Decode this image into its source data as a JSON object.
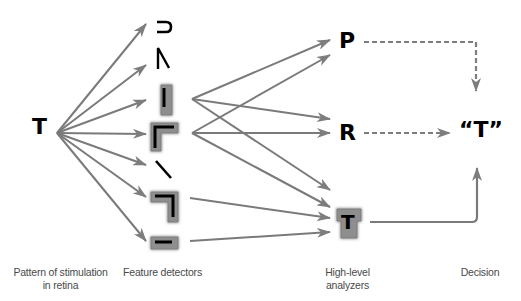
{
  "diagram": {
    "type": "flow",
    "title": "",
    "stages": [
      {
        "id": "retina",
        "label_line1": "Pattern of stimulation",
        "label_line2": "in retina",
        "content": "T"
      },
      {
        "id": "features",
        "label": "Feature detectors",
        "items": [
          "curve",
          "angle-up",
          "vertical-line",
          "corner-top-left",
          "diagonal",
          "corner-top-right",
          "horizontal-line"
        ]
      },
      {
        "id": "analyzers",
        "label_line1": "High-level",
        "label_line2": "analyzers",
        "items": [
          "P",
          "R",
          "T"
        ]
      },
      {
        "id": "decision",
        "label": "Decision",
        "content": "“T”"
      }
    ],
    "retina_letter": "T",
    "analyzers": {
      "p": "P",
      "r": "R",
      "t": "T"
    },
    "decision_text": "“T”",
    "labels": {
      "retina_1": "Pattern of stimulation",
      "retina_2": "in retina",
      "features": "Feature detectors",
      "analyzers_1": "High-level",
      "analyzers_2": "analyzers",
      "decision": "Decision"
    },
    "highlighted_features": [
      "vertical-line",
      "corner-top-left",
      "corner-top-right",
      "horizontal-line"
    ],
    "highlighted_analyzer": "T",
    "edges": [
      {
        "from": "retina",
        "to": "curve",
        "style": "solid"
      },
      {
        "from": "retina",
        "to": "angle-up",
        "style": "solid"
      },
      {
        "from": "retina",
        "to": "vertical-line",
        "style": "solid"
      },
      {
        "from": "retina",
        "to": "corner-top-left",
        "style": "solid"
      },
      {
        "from": "retina",
        "to": "diagonal",
        "style": "solid"
      },
      {
        "from": "retina",
        "to": "corner-top-right",
        "style": "solid"
      },
      {
        "from": "retina",
        "to": "horizontal-line",
        "style": "solid"
      },
      {
        "from": "vertical-line",
        "to": "P",
        "style": "solid"
      },
      {
        "from": "vertical-line",
        "to": "R",
        "style": "solid"
      },
      {
        "from": "vertical-line",
        "to": "T",
        "style": "solid"
      },
      {
        "from": "corner-top-left",
        "to": "P",
        "style": "solid"
      },
      {
        "from": "corner-top-left",
        "to": "R",
        "style": "solid"
      },
      {
        "from": "corner-top-left",
        "to": "T",
        "style": "solid"
      },
      {
        "from": "corner-top-right",
        "to": "T",
        "style": "solid"
      },
      {
        "from": "horizontal-line",
        "to": "T",
        "style": "solid"
      },
      {
        "from": "P",
        "to": "decision",
        "style": "dashed"
      },
      {
        "from": "R",
        "to": "decision",
        "style": "dashed"
      },
      {
        "from": "T",
        "to": "decision",
        "style": "solid"
      }
    ],
    "colors": {
      "arrow": "#7a7a7a",
      "arrow_head": "#8c8c8c",
      "highlight_box": "#8f8f8f",
      "glyph": "#000000",
      "label": "#4a4a4a"
    }
  }
}
